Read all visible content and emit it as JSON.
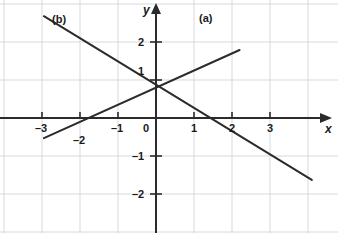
{
  "chart_data": {
    "type": "line",
    "title": "",
    "xlabel": "x",
    "ylabel": "y",
    "xlim": [
      -3.6,
      4.5
    ],
    "ylim": [
      -2.4,
      3.1
    ],
    "grid": true,
    "grid_spacing": 1,
    "legend": "inline-annotations",
    "origin_label": "0",
    "xticks": [
      -3,
      -2,
      -1,
      1,
      2,
      3
    ],
    "xtick_labels": [
      "–3",
      "–2",
      "–1",
      "1",
      "2",
      "3"
    ],
    "yticks": [
      2,
      1,
      -1,
      -2
    ],
    "ytick_labels": [
      "2",
      "1",
      "–1",
      "–2"
    ],
    "series": [
      {
        "name": "(a)",
        "label": "(a)",
        "style": "straight-line-rising",
        "slope": 0.45,
        "intercept": 0.8,
        "x_intercept": -1.8,
        "y_intercept": 0.8,
        "x": [
          -2.95,
          2.2
        ],
        "values": [
          -0.53,
          1.79
        ],
        "endpoints": [
          [
            -2.95,
            -0.53
          ],
          [
            2.2,
            1.79
          ]
        ]
      },
      {
        "name": "(b)",
        "label": "(b)",
        "style": "straight-line-falling",
        "slope": -0.63,
        "intercept": 0.82,
        "x_intercept": 1.28,
        "y_intercept": 0.82,
        "x": [
          -2.95,
          4.1
        ],
        "values": [
          2.68,
          -1.63
        ],
        "endpoints": [
          [
            -2.95,
            2.68
          ],
          [
            4.1,
            -1.63
          ]
        ]
      }
    ],
    "intersection": [
      -0.05,
      0.95
    ],
    "annotations": [
      {
        "text": "(a)",
        "x": 1.3,
        "y": 2.85
      },
      {
        "text": "(b)",
        "x": -2.65,
        "y": 2.75
      }
    ],
    "colors": {
      "line": "#2b2b2b",
      "axis": "#2b2b2b",
      "grid": "#d3d6dc",
      "background": "#ffffff",
      "text": "#1a1a1a"
    }
  },
  "axes": {
    "x_axis_name": "x",
    "y_axis_name": "y",
    "origin_label": "0"
  },
  "tick_labels": {
    "x": [
      "–3",
      "–2",
      "–1",
      "1",
      "2",
      "3"
    ],
    "y": [
      "2",
      "1",
      "–1",
      "–2"
    ]
  },
  "curve_labels": {
    "a": "(a)",
    "b": "(b)"
  }
}
